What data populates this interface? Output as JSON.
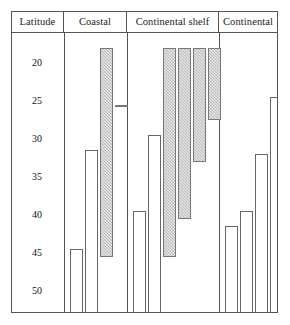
{
  "header": {
    "cells": [
      {
        "label": "Latitude",
        "width_px": 52
      },
      {
        "label": "Coastal",
        "width_px": 63
      },
      {
        "label": "Continental shelf",
        "width_px": 92
      },
      {
        "label": "Continental",
        "width_px": 58
      }
    ]
  },
  "axis": {
    "ticks": [
      {
        "label": "20",
        "value": 20,
        "y_px": 30
      },
      {
        "label": "25",
        "value": 25,
        "y_px": 68
      },
      {
        "label": "30",
        "value": 30,
        "y_px": 106
      },
      {
        "label": "35",
        "value": 35,
        "y_px": 144
      },
      {
        "label": "40",
        "value": 40,
        "y_px": 182
      },
      {
        "label": "45",
        "value": 45,
        "y_px": 220
      },
      {
        "label": "50",
        "value": 50,
        "y_px": 258
      }
    ]
  },
  "colors": {
    "frame": "#555555",
    "bar_outline": "#666666",
    "open_fill": "#ffffff",
    "shaded_fill": "#b9b9b9",
    "text": "#111111"
  },
  "chart_data": {
    "type": "bar",
    "title": "",
    "subtitle": "",
    "xlabel": "",
    "ylabel": "Latitude",
    "ylim": [
      17.5,
      52.5
    ],
    "y_inverted": true,
    "grid": false,
    "legend_position": "none",
    "categories": [
      "Coastal",
      "Continental shelf",
      "Continental"
    ],
    "series": [
      {
        "name": "open",
        "label": "Open bar"
      },
      {
        "name": "shaded",
        "label": "Shaded bar"
      }
    ],
    "groups": [
      {
        "name": "Coastal",
        "bars": [
          {
            "index": 1,
            "fill": "open",
            "top_latitude": 44.5,
            "x_px": 6,
            "width_px": 13
          },
          {
            "index": 2,
            "fill": "open",
            "top_latitude": 31.5,
            "x_px": 21,
            "width_px": 13
          },
          {
            "index": 3,
            "fill": "shaded",
            "top_latitude": 18.0,
            "x_px": 36,
            "width_px": 13
          },
          {
            "index": 4,
            "fill": "shaded",
            "top_latitude": 25.5,
            "x_px": 51,
            "width_px": 13
          }
        ]
      },
      {
        "name": "Continental shelf",
        "bars": [
          {
            "index": 1,
            "fill": "open",
            "top_latitude": 39.5,
            "x_px": 6,
            "width_px": 13
          },
          {
            "index": 2,
            "fill": "open",
            "top_latitude": 29.5,
            "x_px": 21,
            "width_px": 13
          },
          {
            "index": 3,
            "fill": "shaded",
            "top_latitude": 18.0,
            "x_px": 36,
            "width_px": 13
          },
          {
            "index": 4,
            "fill": "shaded",
            "top_latitude": 18.0,
            "x_px": 51,
            "width_px": 13
          },
          {
            "index": 5,
            "fill": "shaded",
            "top_latitude": 18.0,
            "x_px": 66,
            "width_px": 13
          },
          {
            "index": 6,
            "fill": "shaded",
            "top_latitude": 18.0,
            "x_px": 81,
            "width_px": 13
          }
        ]
      },
      {
        "name": "Continental",
        "bars": [
          {
            "index": 1,
            "fill": "open",
            "top_latitude": 41.5,
            "x_px": 6,
            "width_px": 13
          },
          {
            "index": 2,
            "fill": "open",
            "top_latitude": 39.5,
            "x_px": 21,
            "width_px": 13
          },
          {
            "index": 3,
            "fill": "open",
            "top_latitude": 32.0,
            "x_px": 36,
            "width_px": 13
          },
          {
            "index": 4,
            "fill": "open",
            "top_latitude": 24.5,
            "x_px": 51,
            "width_px": 13
          },
          {
            "index": 5,
            "fill": "shaded",
            "top_latitude": 18.0,
            "x_px": 66,
            "width_px": 13
          }
        ]
      }
    ],
    "shaded_bar_bottoms": [
      {
        "group": "Coastal",
        "index": 3,
        "bottom_latitude": 45.5
      },
      {
        "group": "Coastal",
        "index": 4,
        "bottom_latitude": 25.5
      },
      {
        "group": "Continental shelf",
        "index": 3,
        "bottom_latitude": 45.5
      },
      {
        "group": "Continental shelf",
        "index": 4,
        "bottom_latitude": 40.5
      },
      {
        "group": "Continental shelf",
        "index": 5,
        "bottom_latitude": 33.0
      },
      {
        "group": "Continental shelf",
        "index": 6,
        "bottom_latitude": 27.5
      },
      {
        "group": "Continental",
        "index": 5,
        "bottom_latitude": 35.0
      }
    ]
  }
}
